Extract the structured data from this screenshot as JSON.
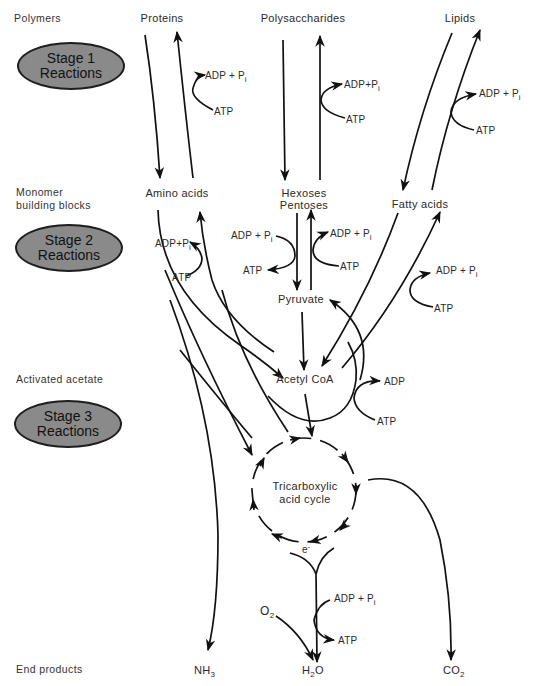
{
  "side_labels": {
    "polymers": "Polymers",
    "monomer_line1": "Monomer",
    "monomer_line2": "building blocks",
    "activated_acetate": "Activated acetate",
    "end_products": "End products"
  },
  "stages": [
    {
      "line1": "Stage 1",
      "line2": "Reactions"
    },
    {
      "line1": "Stage 2",
      "line2": "Reactions"
    },
    {
      "line1": "Stage 3",
      "line2": "Reactions"
    }
  ],
  "polymers": {
    "proteins": "Proteins",
    "polysaccharides": "Polysaccharides",
    "lipids": "Lipids"
  },
  "monomers": {
    "amino_acids": "Amino acids",
    "hexoses": "Hexoses",
    "pentoses": "Pentoses",
    "fatty_acids": "Fatty acids"
  },
  "intermediates": {
    "pyruvate": "Pyruvate",
    "acetyl_coa": "Acetyl CoA",
    "tca_line1": "Tricarboxylic",
    "tca_line2": "acid cycle",
    "electron": "e",
    "electron_charge": "-"
  },
  "end_products": {
    "nh3_main": "NH",
    "nh3_sub": "3",
    "h2o_h": "H",
    "h2o_sub": "2",
    "h2o_o": "O",
    "co2_main": "CO",
    "co2_sub": "2",
    "o2_main": "O",
    "o2_sub": "2"
  },
  "energy": {
    "atp": "ATP",
    "adp": "ADP",
    "adp_pi": "ADP + P",
    "adp_pi_tight": "ADP+P",
    "pi_sub": "i"
  },
  "colors": {
    "stage_fill": "#8a8a8a",
    "stroke": "#111111",
    "background": "#ffffff"
  }
}
